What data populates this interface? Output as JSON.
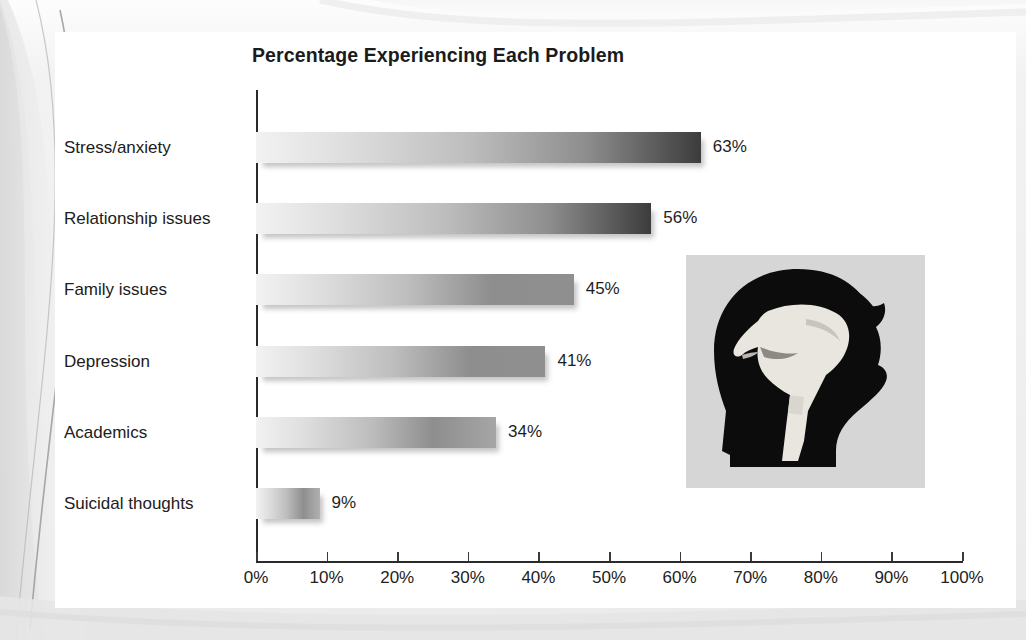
{
  "chart_data": {
    "type": "bar",
    "orientation": "horizontal",
    "title": "Percentage Experiencing Each Problem",
    "xlabel": "",
    "ylabel": "",
    "categories": [
      "Stress/anxiety",
      "Relationship issues",
      "Family issues",
      "Depression",
      "Academics",
      "Suicidal thoughts"
    ],
    "values": [
      63,
      56,
      45,
      41,
      34,
      9
    ],
    "data_labels": [
      "63%",
      "56%",
      "45%",
      "41%",
      "34%",
      "9%"
    ],
    "xlim": [
      0,
      100
    ],
    "xtick_values": [
      0,
      10,
      20,
      30,
      40,
      50,
      60,
      70,
      80,
      90,
      100
    ],
    "xtick_labels": [
      "0%",
      "10%",
      "20%",
      "30%",
      "40%",
      "50%",
      "60%",
      "70%",
      "80%",
      "90%",
      "100%"
    ],
    "grid": false,
    "legend": null,
    "series": [
      {
        "name": "Percentage experiencing each problem",
        "values": [
          63,
          56,
          45,
          41,
          34,
          9
        ]
      }
    ]
  },
  "colors": {
    "page_background": "#f1f1f1",
    "panel_background": "#ffffff",
    "axis": "#2a2a2a",
    "text": "#1e1e1e",
    "bar_gradient_start": "#f2f2f2",
    "bar_gradient_end": "#444444",
    "bar_shadow": "rgba(60,60,60,0.30)",
    "illustration_background": "#d6d6d6",
    "illustration_silhouette": "#0c0c0c",
    "illustration_figure": "#e9e6e0"
  },
  "illustration": {
    "name": "head-silhouette-with-curled-figure",
    "description": "Black profile silhouette of a head facing right containing a light curled-up seated figure"
  }
}
